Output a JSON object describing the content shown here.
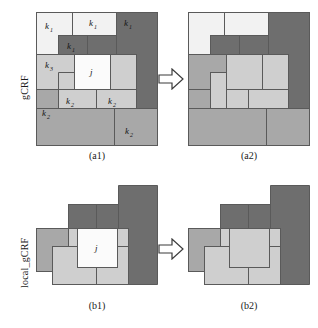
{
  "figure": {
    "title_row_labels": [
      {
        "name": "gcrf",
        "text": "gCRF"
      },
      {
        "name": "local-gcrf",
        "text": "local_gCRF"
      }
    ],
    "captions": [
      {
        "name": "caption-a1",
        "text": "(a1)"
      },
      {
        "name": "caption-a2",
        "text": "(a2)"
      },
      {
        "name": "caption-b1",
        "text": "(b1)"
      },
      {
        "name": "caption-b2",
        "text": "(b2)"
      }
    ],
    "colors": {
      "dark_gray": "#6e6e6e",
      "medium_gray": "#a8a8a8",
      "light_gray": "#c9c9c9",
      "pale_gray": "#dcdcdc",
      "white": "#fbfbfb",
      "stroke": "#5a5a5a",
      "text": "#151515",
      "background": "#ffffff"
    },
    "cell_labels": {
      "k1": {
        "base": "k",
        "sub": "1"
      },
      "k2": {
        "base": "k",
        "sub": "2"
      },
      "k3": {
        "base": "k",
        "sub": "3"
      },
      "j": {
        "base": "j",
        "sub": ""
      }
    },
    "panels": [
      {
        "name": "panel-a1",
        "caption": "(a1)",
        "labels": [
          {
            "id": "k1-top-left",
            "base": "k",
            "sub": "1"
          },
          {
            "id": "k1-top-mid",
            "base": "k",
            "sub": "1"
          },
          {
            "id": "k1-top-right",
            "base": "k",
            "sub": "1"
          },
          {
            "id": "k1-inner-dark",
            "base": "k",
            "sub": "1"
          },
          {
            "id": "k3-left",
            "base": "k",
            "sub": "3"
          },
          {
            "id": "j-center",
            "base": "j",
            "sub": ""
          },
          {
            "id": "k2-lower-left",
            "base": "k",
            "sub": "2"
          },
          {
            "id": "k2-lower-right",
            "base": "k",
            "sub": "2"
          },
          {
            "id": "k2-bottom-left",
            "base": "k",
            "sub": "2"
          },
          {
            "id": "k2-bottom-right",
            "base": "k",
            "sub": "2"
          }
        ]
      },
      {
        "name": "panel-a2",
        "caption": "(a2)",
        "labels": []
      },
      {
        "name": "panel-b1",
        "caption": "(b1)",
        "labels": [
          {
            "id": "j-center",
            "base": "j",
            "sub": ""
          }
        ]
      },
      {
        "name": "panel-b2",
        "caption": "(b2)",
        "labels": []
      }
    ]
  }
}
